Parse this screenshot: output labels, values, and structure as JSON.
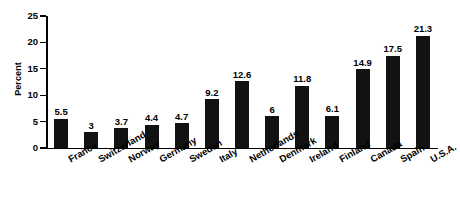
{
  "chart_data": {
    "type": "bar",
    "title": "",
    "subtitle": "",
    "xlabel": "",
    "ylabel": "Percent",
    "ylim": [
      0,
      25
    ],
    "yticks": [
      0,
      5,
      10,
      15,
      20,
      25
    ],
    "ytick_labels": [
      "0",
      "5",
      "10",
      "15",
      "20",
      "25"
    ],
    "grid": false,
    "legend": null,
    "bar_color": "#121212",
    "axis_color": "#000000",
    "background": "#ffffff",
    "data_labels_shown": true,
    "categories": [
      "France",
      "Switzerland",
      "Norway",
      "Germany",
      "Sweden",
      "Italy",
      "Netherlands",
      "Denmark",
      "Ireland",
      "Finland",
      "Canada",
      "Spain",
      "U.S.A."
    ],
    "values": [
      5.5,
      3,
      3.7,
      4.4,
      4.7,
      9.2,
      12.6,
      6,
      11.8,
      6.1,
      14.9,
      17.5,
      21.3
    ],
    "value_labels": [
      "5.5",
      "3",
      "3.7",
      "4.4",
      "4.7",
      "9.2",
      "12.6",
      "6",
      "11.8",
      "6.1",
      "14.9",
      "17.5",
      "21.3"
    ]
  }
}
